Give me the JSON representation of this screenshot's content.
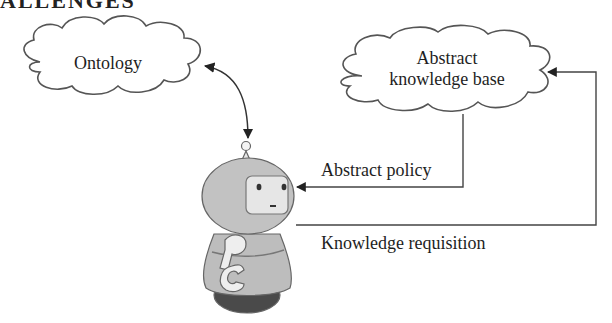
{
  "header": {
    "text": "ALLENGES"
  },
  "nodes": {
    "ontology": {
      "label": "Ontology"
    },
    "knowledge_base": {
      "line1": "Abstract",
      "line2": "knowledge base"
    },
    "agent": {
      "icon": "robot-icon"
    }
  },
  "edges": {
    "abstract_policy": {
      "label": "Abstract policy"
    },
    "knowledge_requisition": {
      "label": "Knowledge requisition"
    }
  },
  "colors": {
    "stroke": "#555555",
    "robot_body": "#bdbdbd",
    "robot_face": "#e6e6e6",
    "robot_wheel": "#4a4a4a"
  }
}
